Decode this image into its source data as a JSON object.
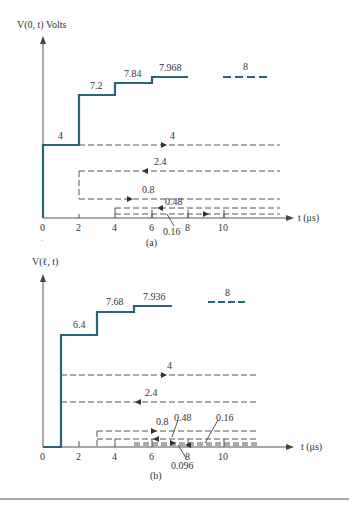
{
  "figure_a": {
    "caption": "(a)",
    "y_label": "V(0, t) Volts",
    "x_label": "t (μs)",
    "x_ticks": [
      "0",
      "2",
      "4",
      "6",
      "8",
      "10"
    ],
    "step_labels": [
      "4",
      "7.2",
      "7.84",
      "7.968"
    ],
    "asymptote_label": "8",
    "wave_labels": [
      "4",
      "2.4",
      "0.8",
      "0.48",
      "0.16"
    ]
  },
  "figure_b": {
    "caption": "(b)",
    "y_label": "V(ℓ, t)",
    "x_label": "t (μs)",
    "x_ticks": [
      "0",
      "2",
      "4",
      "6",
      "8",
      "10"
    ],
    "step_labels": [
      "6.4",
      "7.68",
      "7.936"
    ],
    "asymptote_label": "8",
    "wave_labels": [
      "4",
      "2.4",
      "0.8",
      "0.48",
      "0.16",
      "0.096"
    ]
  },
  "colors": {
    "step_line": "#2a6478",
    "axis": "#555555",
    "dashed": "#555555"
  }
}
